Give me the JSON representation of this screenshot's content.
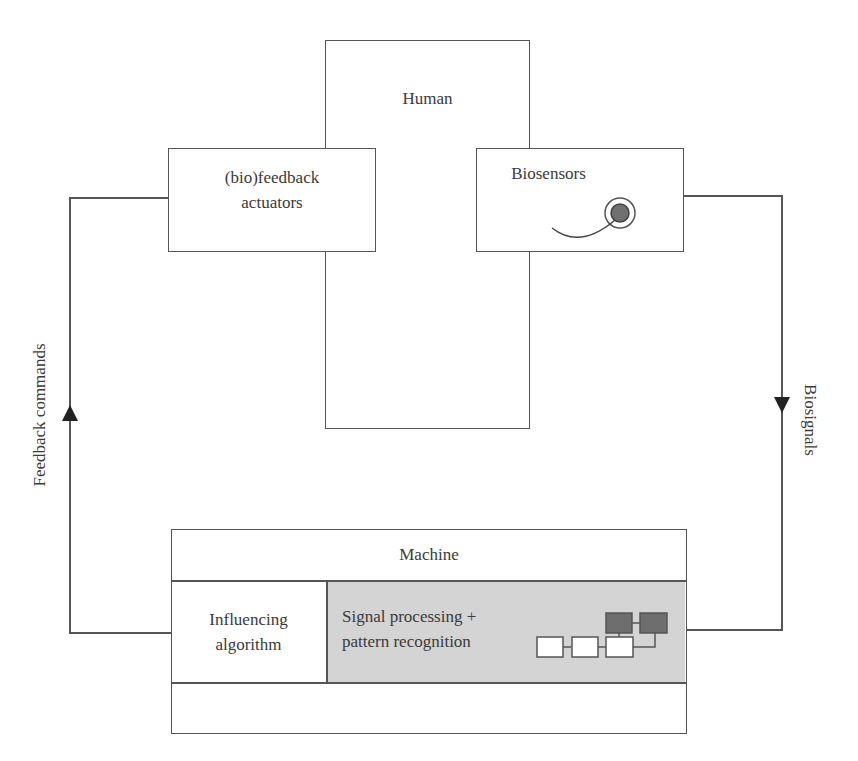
{
  "diagram": {
    "human": {
      "label": "Human"
    },
    "actuators": {
      "label_line1": "(bio)feedback",
      "label_line2": "actuators"
    },
    "biosensors": {
      "label": "Biosensors",
      "icon": "sensor-electrode-icon"
    },
    "machine": {
      "label": "Machine",
      "influencing": {
        "line1": "Influencing",
        "line2": "algorithm"
      },
      "processing": {
        "line1": "Signal processing +",
        "line2": "pattern recognition",
        "icon": "block-network-icon"
      }
    },
    "edges": {
      "left": {
        "label": "Feedback commands",
        "direction": "up"
      },
      "right": {
        "label": "Biosignals",
        "direction": "down"
      }
    },
    "colors": {
      "line": "#555555",
      "processing_fill": "#d4d4d4",
      "dark_block": "#6e6e6e",
      "sensor_dot": "#707070"
    }
  }
}
